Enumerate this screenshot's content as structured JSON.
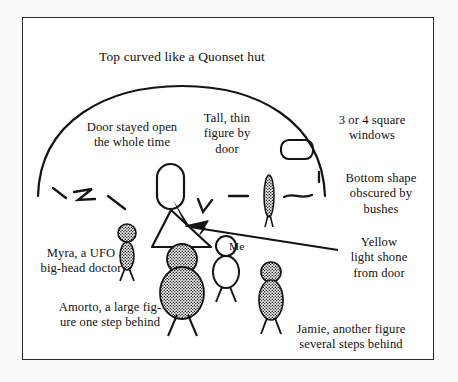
{
  "figure": {
    "medium": "hand-drawn ink sketch",
    "background_color": "#fbfbfa",
    "ink_color": "#111111",
    "frame_color": "#2a2a2a"
  },
  "annotations": {
    "title": "Top curved like a Quonset hut",
    "door": "Door stayed open\nthe whole time",
    "tall_figure": "Tall, thin\nfigure by\ndoor",
    "windows": "3 or 4 square\nwindows",
    "bottom_shape": "Bottom shape\nobscured by\nbushes",
    "yellow_light": "Yellow\nlight shone\nfrom door",
    "me": "Me",
    "myra": "Myra, a UFO\nbig-head doctor",
    "amorto": "Amorto, a large fig-\nure one step behind",
    "jamie": "Jamie, another figure\nseveral steps behind"
  },
  "drawn_elements": {
    "craft_dome": "large semicircular arc (Quonset-hut profile)",
    "door_shape": "tall rounded rectangle opening",
    "window_shape": "small rounded rectangle window",
    "light_beam": "open triangle of yellow light from door",
    "pointer_arrow": "arrow from Yellow light caption to beam",
    "bushes": "short irregular ink strokes along ground line",
    "figures": [
      {
        "name": "tall-thin-figure",
        "fill": "stippled",
        "build": "narrow tall ellipse"
      },
      {
        "name": "myra-figure",
        "fill": "stippled",
        "build": "small round head, slim body"
      },
      {
        "name": "amorto-figure",
        "fill": "stippled",
        "build": "large round head, broad body"
      },
      {
        "name": "me-figure",
        "fill": "unfilled outline",
        "build": "round head, oval body"
      },
      {
        "name": "jamie-figure",
        "fill": "stippled",
        "build": "round head, oval body"
      }
    ]
  }
}
